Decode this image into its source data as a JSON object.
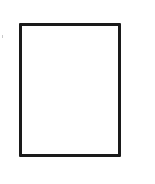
{
  "canvas": {
    "width": 155,
    "height": 184,
    "background": "#ffffff"
  },
  "shapes": [
    {
      "type": "rectangle",
      "fill": "#ffffff",
      "stroke": "#1a1a1a",
      "stroke_width": 3
    }
  ],
  "colors": {
    "stroke": "#1a1a1a",
    "tick": "#c8c8c8"
  }
}
